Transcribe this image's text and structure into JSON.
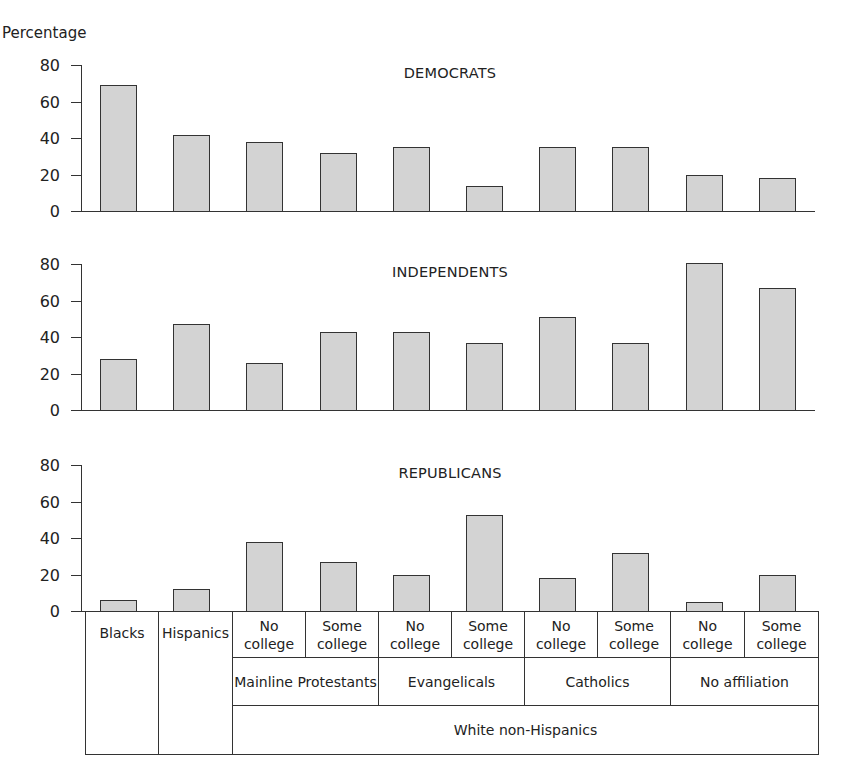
{
  "chart_data": {
    "type": "bar",
    "ylabel": "Percentage",
    "ylim": [
      0,
      80
    ],
    "yticks": [
      0,
      20,
      40,
      60,
      80
    ],
    "grid": false,
    "categories": [
      "Blacks",
      "Hispanics",
      "White non-Hispanics / Mainline Protestants / No college",
      "White non-Hispanics / Mainline Protestants / Some college",
      "White non-Hispanics / Evangelicals / No college",
      "White non-Hispanics / Evangelicals / Some college",
      "White non-Hispanics / Catholics / No college",
      "White non-Hispanics / Catholics / Some college",
      "White non-Hispanics / No affiliation / No college",
      "White non-Hispanics / No affiliation / Some college"
    ],
    "panels": [
      {
        "title": "DEMOCRATS",
        "values": [
          69,
          42,
          38,
          32,
          35,
          14,
          35,
          35,
          20,
          18
        ]
      },
      {
        "title": "INDEPENDENTS",
        "values": [
          28,
          47,
          26,
          43,
          43,
          37,
          51,
          37,
          81,
          67
        ]
      },
      {
        "title": "REPUBLICANS",
        "values": [
          6,
          12,
          38,
          27,
          20,
          53,
          18,
          32,
          5,
          20
        ]
      }
    ],
    "category_table": {
      "row1": [
        "Blacks",
        "Hispanics",
        "No college",
        "Some college",
        "No college",
        "Some college",
        "No college",
        "Some college",
        "No college",
        "Some college"
      ],
      "row2": [
        "Mainline Protestants",
        "Evangelicals",
        "Catholics",
        "No affiliation"
      ],
      "row3": [
        "White non-Hispanics"
      ]
    }
  }
}
